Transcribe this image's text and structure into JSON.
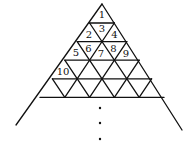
{
  "diagram": {
    "type": "triangular-grid-pyramid",
    "rows_drawn": 5,
    "labels": [
      {
        "text": "1",
        "row": 1,
        "index": 1
      },
      {
        "text": "2",
        "row": 2,
        "index": 1
      },
      {
        "text": "3",
        "row": 2,
        "index": 2
      },
      {
        "text": "4",
        "row": 2,
        "index": 3
      },
      {
        "text": "5",
        "row": 3,
        "index": 1
      },
      {
        "text": "6",
        "row": 3,
        "index": 2
      },
      {
        "text": "7",
        "row": 3,
        "index": 3
      },
      {
        "text": "8",
        "row": 3,
        "index": 4
      },
      {
        "text": "9",
        "row": 3,
        "index": 5
      },
      {
        "text": "10",
        "row": 4,
        "index": 1
      }
    ],
    "continuation": "vertical ellipsis (three dots) below the grid, outer edges extend downward"
  }
}
